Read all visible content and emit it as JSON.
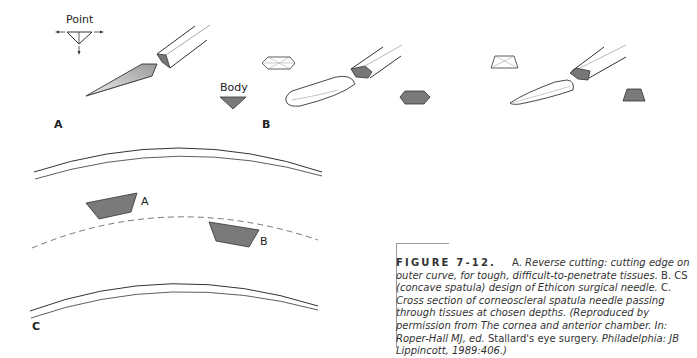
{
  "figure": {
    "panels": {
      "a": {
        "label": "A",
        "point_label": "Point",
        "body_label": "Body"
      },
      "b": {
        "label": "B"
      },
      "c": {
        "label": "C",
        "needle_a": "A",
        "needle_b": "B"
      }
    },
    "caption": {
      "number": "FIGURE 7-12.",
      "part_a_label": "A.",
      "part_a_text": "Reverse cutting: cutting edge on outer curve, for tough, difficult-to-penetrate tissues.",
      "part_b_label": "B. CS",
      "part_b_text": "(concave spatula) design of Ethicon surgical needle.",
      "part_c_label": "C.",
      "part_c_text": "Cross section of corneoscleral spatula needle passing through tissues at chosen depths. (Reproduced by permission from The cornea and anterior chamber. In: Roper-Hall MJ, ed.",
      "book_title": "Stallard's eye surgery.",
      "publisher": "Philadelphia: JB Lippincott, 1989:406.)"
    },
    "colors": {
      "fill_dark": "#7a7a7a",
      "stroke": "#333333",
      "text": "#333333"
    }
  }
}
